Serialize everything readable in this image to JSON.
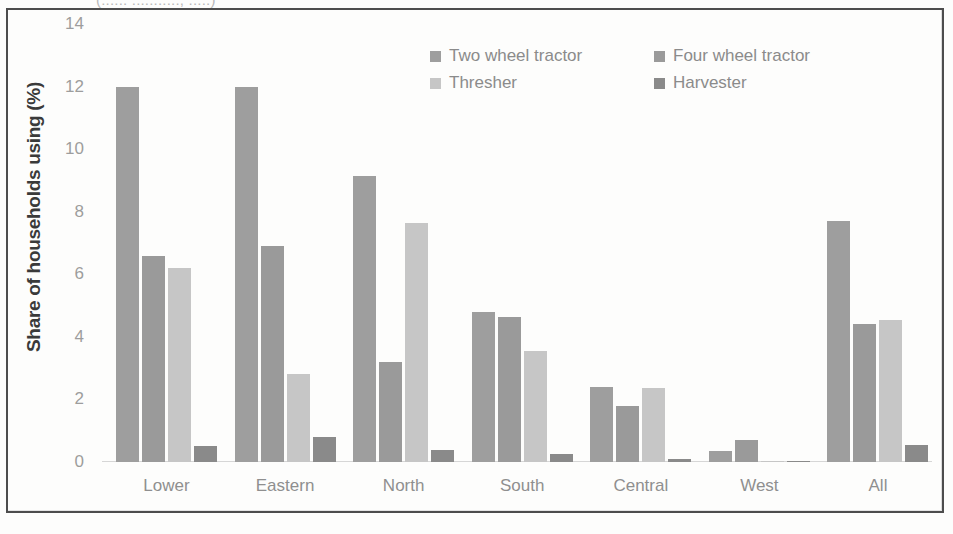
{
  "page": {
    "top_clipped_text": "(:::::: :::::::::::, :::::)"
  },
  "chart_data": {
    "type": "bar",
    "title": "",
    "xlabel": "",
    "ylabel": "Share of households using (%)",
    "categories": [
      "Lower",
      "Eastern",
      "North",
      "South",
      "Central",
      "West",
      "All"
    ],
    "series": [
      {
        "name": "Two wheel tractor",
        "color": "#9e9e9e",
        "values": [
          12.0,
          12.0,
          9.15,
          4.8,
          2.4,
          0.35,
          7.7
        ]
      },
      {
        "name": "Four wheel tractor",
        "color": "#9a9a9a",
        "values": [
          6.6,
          6.9,
          3.2,
          4.65,
          1.8,
          0.7,
          4.4
        ]
      },
      {
        "name": "Thresher",
        "color": "#c6c6c6",
        "values": [
          6.2,
          2.8,
          7.65,
          3.55,
          2.35,
          0.02,
          4.55
        ]
      },
      {
        "name": "Harvester",
        "color": "#8a8a8a",
        "values": [
          0.5,
          0.8,
          0.4,
          0.25,
          0.1,
          0.02,
          0.55
        ]
      }
    ],
    "yticks": [
      0,
      2,
      4,
      6,
      8,
      10,
      12,
      14
    ],
    "ylim": [
      0,
      14
    ],
    "grid": false,
    "legend_position": "top-right",
    "legend_columns": 2
  }
}
